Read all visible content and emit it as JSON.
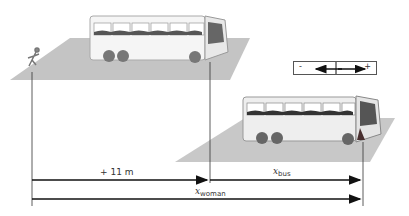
{
  "diagram": {
    "labels": {
      "offset": "+ 11 m",
      "x_bus": "x",
      "x_bus_sub": "bus",
      "x_woman": "x",
      "x_woman_sub": "woman"
    },
    "legend": {
      "minus": "-",
      "plus": "+"
    },
    "colors": {
      "ground": "#b8b8b8",
      "line": "#222222",
      "bus_body": "#f2f2f2"
    }
  }
}
